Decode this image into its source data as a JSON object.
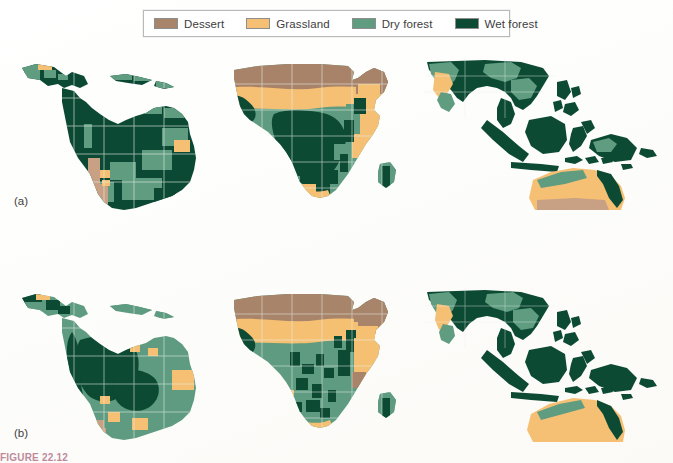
{
  "figure": {
    "caption": "FIGURE 22.12",
    "panels": [
      {
        "id": "a",
        "label": "(a)"
      },
      {
        "id": "b",
        "label": "(b)"
      }
    ]
  },
  "legend": {
    "items": [
      {
        "label": "Dessert",
        "color": "#a8846a"
      },
      {
        "label": "Grassland",
        "color": "#f6c074"
      },
      {
        "label": "Dry forest",
        "color": "#5f9c80"
      },
      {
        "label": "Wet forest",
        "color": "#0d4a34"
      }
    ]
  },
  "map_data": {
    "type": "choropleth-landcover",
    "classes": [
      "Dessert",
      "Grassland",
      "Dry forest",
      "Wet forest"
    ],
    "class_colors": {
      "Dessert": "#a8846a",
      "Grassland": "#f6c074",
      "Dry forest": "#5f9c80",
      "Wet forest": "#0d4a34"
    },
    "rows": [
      {
        "panel": "(a)",
        "regions": [
          {
            "name": "Latin America",
            "dominant": "Wet forest"
          },
          {
            "name": "Africa",
            "dominant": "Wet forest"
          },
          {
            "name": "Southeast Asia",
            "dominant": "Wet forest"
          }
        ]
      },
      {
        "panel": "(b)",
        "regions": [
          {
            "name": "Latin America",
            "dominant": "Dry forest"
          },
          {
            "name": "Africa",
            "dominant": "Dry forest"
          },
          {
            "name": "Southeast Asia",
            "dominant": "Wet forest"
          }
        ]
      }
    ],
    "grid": "graticule",
    "background": "#ffffff"
  }
}
